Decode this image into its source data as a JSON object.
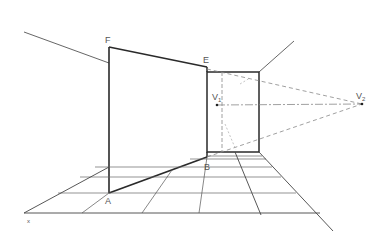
{
  "figure": {
    "type": "two-point perspective construction",
    "labels": {
      "F": "F",
      "E": "E",
      "B": "B",
      "A": "A",
      "V1": "V",
      "V1_sub": "1",
      "V2": "V",
      "V2_sub": "2",
      "corner_mark": "x"
    },
    "points": {
      "F": [
        109,
        47
      ],
      "E": [
        207,
        67
      ],
      "A": [
        109,
        193
      ],
      "B": [
        207,
        157
      ],
      "V1": [
        217,
        105
      ],
      "V2": [
        362,
        104
      ]
    },
    "colors": {
      "line": "#2a2a2a",
      "thin_line": "#555555",
      "dashed": "#888888",
      "label": "#555555"
    }
  }
}
